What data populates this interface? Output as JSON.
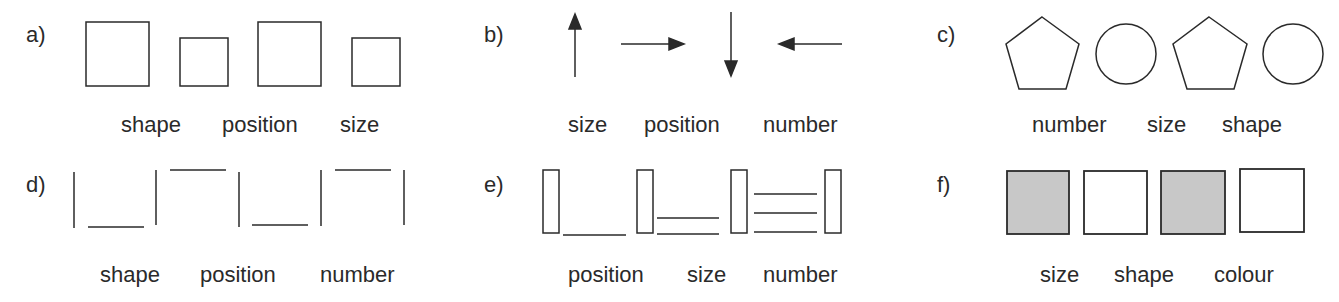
{
  "colors": {
    "stroke": "#2a2a2a",
    "fill_gray": "#c8c8c8",
    "background": "#ffffff"
  },
  "panels": [
    {
      "id": "a",
      "label": "a)",
      "glyphs": "four squares: large, small, large, small",
      "words": [
        "shape",
        "position",
        "size"
      ]
    },
    {
      "id": "b",
      "label": "b)",
      "glyphs": "four arrows: up, right, down, left",
      "words": [
        "size",
        "position",
        "number"
      ]
    },
    {
      "id": "c",
      "label": "c)",
      "glyphs": "pentagon, circle, pentagon, circle",
      "words": [
        "number",
        "size",
        "shape"
      ]
    },
    {
      "id": "d",
      "label": "d)",
      "glyphs": "vertical bars alternating with low and high horizontal lines",
      "words": [
        "shape",
        "position",
        "number"
      ]
    },
    {
      "id": "e",
      "label": "e)",
      "glyphs": "narrow rectangles separated by one, two and three horizontal lines",
      "words": [
        "position",
        "size",
        "number"
      ]
    },
    {
      "id": "f",
      "label": "f)",
      "glyphs": "gray square, white square, gray square, white square",
      "words": [
        "size",
        "shape",
        "colour"
      ]
    }
  ]
}
